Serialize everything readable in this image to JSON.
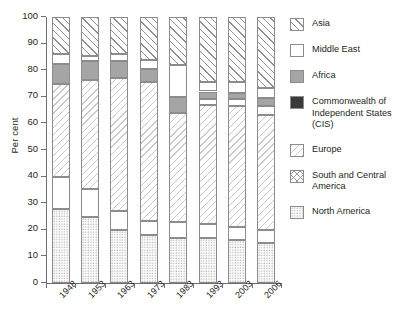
{
  "chart_data": {
    "type": "bar",
    "subtype": "stacked-percentage",
    "title": "",
    "xlabel": "",
    "ylabel": "Per cent",
    "ylim": [
      0,
      100
    ],
    "yticks": [
      0,
      10,
      20,
      30,
      40,
      50,
      60,
      70,
      80,
      90,
      100
    ],
    "grid": false,
    "legend_position": "right",
    "categories": [
      "1948",
      "1953",
      "1963",
      "1973",
      "1983",
      "1993",
      "2003",
      "2006"
    ],
    "series": [
      {
        "name": "North America",
        "pattern": "fine-dots",
        "values": [
          28,
          25,
          20,
          18,
          17,
          17,
          16,
          15
        ]
      },
      {
        "name": "South and Central America",
        "pattern": "cross-hatch",
        "values": [
          12,
          10.5,
          7,
          5.5,
          6,
          5,
          5,
          5
        ]
      },
      {
        "name": "Europe",
        "pattern": "light-diagonal",
        "values": [
          35,
          41,
          50,
          52,
          41,
          45,
          45.5,
          43
        ]
      },
      {
        "name": "Commonwealth of Independent States (CIS)",
        "pattern": "solid-black",
        "color": "#3a3a3a",
        "values": [
          0,
          0,
          0,
          0,
          0,
          2,
          2.5,
          3.5
        ]
      },
      {
        "name": "Africa",
        "pattern": "solid-grey",
        "color": "#a5a5a5",
        "values": [
          7.5,
          7,
          6.5,
          5,
          6,
          3,
          2.5,
          3
        ]
      },
      {
        "name": "Middle East",
        "pattern": "solid-white",
        "color": "#ffffff",
        "values": [
          3.5,
          2,
          2.5,
          3.5,
          12,
          3.5,
          4,
          4
        ]
      },
      {
        "name": "Asia",
        "pattern": "bold-diagonal",
        "values": [
          14,
          14.5,
          14,
          16,
          18,
          24.5,
          24.5,
          26.5
        ]
      }
    ],
    "stack_order_bottom_to_top": [
      "North America",
      "South and Central America",
      "Europe",
      "Commonwealth of Independent States (CIS)",
      "Africa",
      "Middle East",
      "Asia"
    ],
    "legend_order_top_to_bottom": [
      "Asia",
      "Middle East",
      "Africa",
      "Commonwealth of Independent States (CIS)",
      "Europe",
      "South and Central America",
      "North America"
    ]
  },
  "legend": {
    "items": [
      {
        "label": "Asia",
        "key": "asia"
      },
      {
        "label": "Middle East",
        "key": "middle-east"
      },
      {
        "label": "Africa",
        "key": "africa"
      },
      {
        "label": "Commonwealth of Independent States (CIS)",
        "key": "cis"
      },
      {
        "label": "Europe",
        "key": "europe"
      },
      {
        "label": "South and Central America",
        "key": "south-central-america"
      },
      {
        "label": "North America",
        "key": "north-america"
      }
    ]
  }
}
